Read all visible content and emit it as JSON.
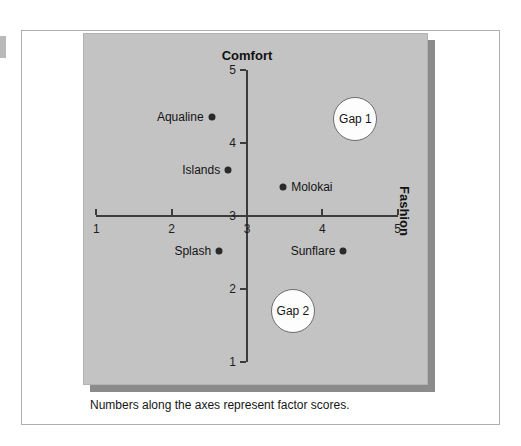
{
  "figure": {
    "caption": "Numbers along the axes represent factor scores.",
    "panel_color": "#c3c3c3",
    "shadow_color": "#8b8b8b",
    "axis_color": "#3c3c3c"
  },
  "chart_data": {
    "type": "scatter",
    "title": "",
    "xlabel": "Fashion",
    "ylabel": "Comfort",
    "xlim": [
      1,
      5
    ],
    "ylim": [
      1,
      5
    ],
    "xticks": [
      "1",
      "2",
      "3",
      "4",
      "5"
    ],
    "yticks": [
      "1",
      "2",
      "3",
      "4",
      "5"
    ],
    "grid": false,
    "legend": "none",
    "points": [
      {
        "label": "Aqualine",
        "x": 2.53,
        "y": 4.35,
        "label_side": "left"
      },
      {
        "label": "Islands",
        "x": 2.75,
        "y": 3.63,
        "label_side": "left"
      },
      {
        "label": "Molokai",
        "x": 3.48,
        "y": 3.4,
        "label_side": "right"
      },
      {
        "label": "Splash",
        "x": 2.63,
        "y": 2.52,
        "label_side": "left"
      },
      {
        "label": "Sunflare",
        "x": 4.28,
        "y": 2.52,
        "label_side": "left"
      }
    ],
    "annotations": [
      {
        "label": "Gap 1",
        "x": 4.44,
        "y": 4.33
      },
      {
        "label": "Gap 2",
        "x": 3.61,
        "y": 1.7
      }
    ]
  }
}
